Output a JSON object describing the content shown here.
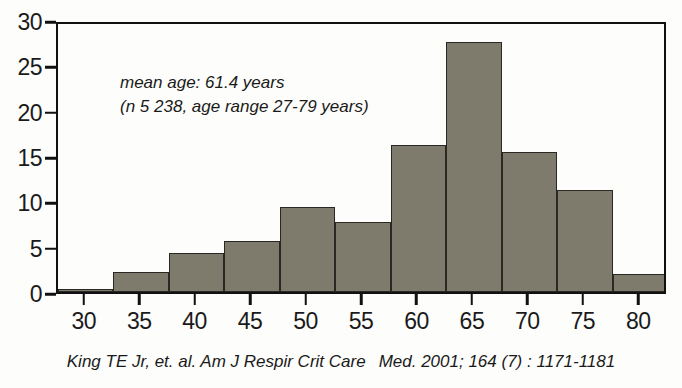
{
  "chart_data": {
    "type": "bar",
    "title": "",
    "subtitle": "",
    "xlabel": "",
    "ylabel": "",
    "xlim": [
      27.5,
      82.5
    ],
    "ylim": [
      0,
      30
    ],
    "grid": false,
    "legend": null,
    "bin_width": 5,
    "bin_starts": [
      27.5,
      32.5,
      37.5,
      42.5,
      47.5,
      52.5,
      57.5,
      62.5,
      67.5,
      72.5,
      77.5
    ],
    "categories": [
      "27.5-32.5",
      "32.5-37.5",
      "37.5-42.5",
      "42.5-47.5",
      "47.5-52.5",
      "52.5-57.5",
      "57.5-62.5",
      "62.5-67.5",
      "67.5-72.5",
      "72.5-77.5",
      "77.5-82.5"
    ],
    "values": [
      0.3,
      2.2,
      4.3,
      5.6,
      9.4,
      7.7,
      16.2,
      27.6,
      15.4,
      11.3,
      2.0
    ],
    "x_ticks": [
      30,
      35,
      40,
      45,
      50,
      55,
      60,
      65,
      70,
      75,
      80
    ],
    "x_tick_labels": [
      "30",
      "35",
      "40",
      "45",
      "50",
      "55",
      "60",
      "65",
      "70",
      "75",
      "80"
    ],
    "y_ticks": [
      0,
      5,
      10,
      15,
      20,
      25,
      30
    ],
    "y_tick_labels": [
      "0",
      "5",
      "10",
      "15",
      "20",
      "25",
      "30"
    ],
    "annotations": [
      "mean age: 61.4 years",
      "(n 5 238, age range 27-79 years)"
    ],
    "bar_color": "#7e7a6c",
    "bar_edge_color": "#2a2823",
    "axis_color": "#111111",
    "background_color": "#fdfdfb"
  },
  "annotation": {
    "line1": "mean age: 61.4 years",
    "line2": "(n 5 238, age range 27-79 years)"
  },
  "caption": {
    "part1": "King TE Jr, et. al. Am J Respir Crit Care",
    "part2": "Med. 2001; 164 (7) : 1171-1181",
    "full": "King TE Jr, et. al. Am J Respir Crit Care   Med. 2001; 164 (7) : 1171-1181"
  }
}
